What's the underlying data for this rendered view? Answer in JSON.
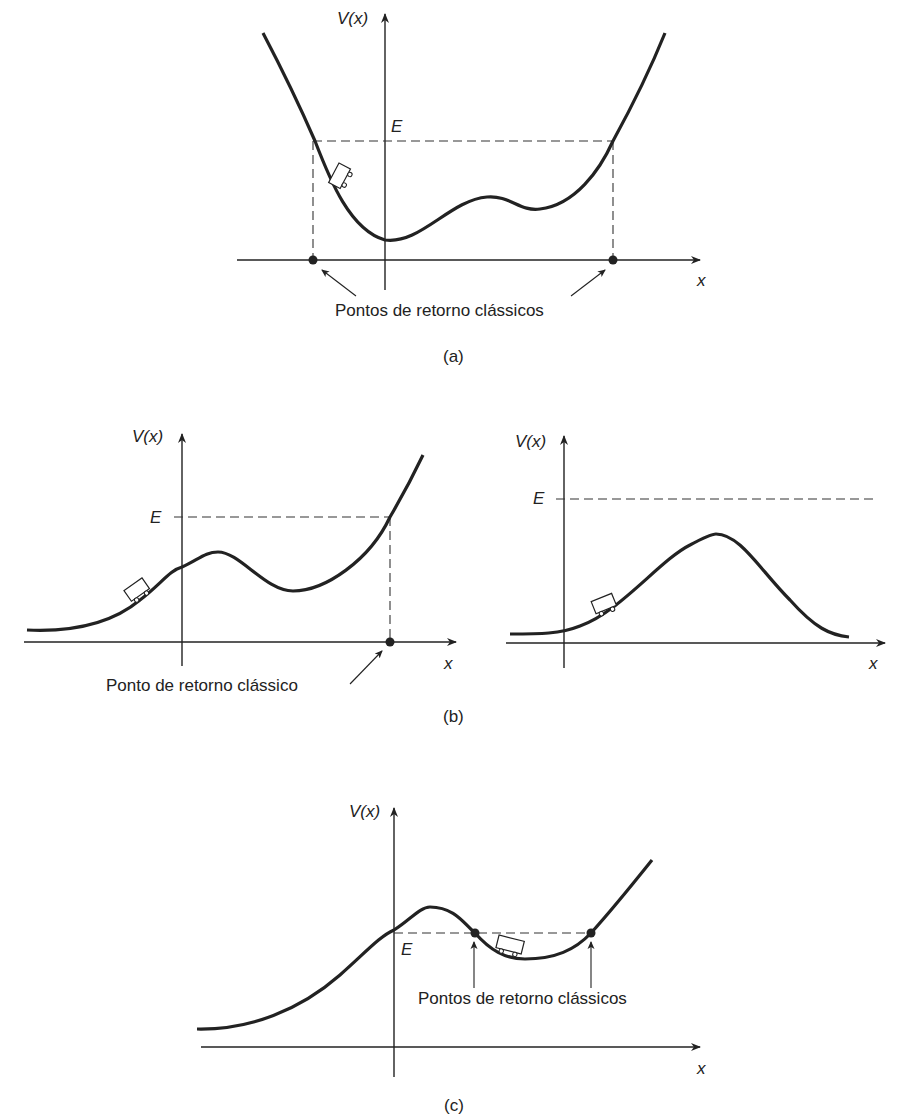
{
  "figure": {
    "panel_a": {
      "caption": "(a)",
      "y_axis_label": "V(x)",
      "x_axis_label": "x",
      "energy_label": "E",
      "annotation": "Pontos de retorno clássicos"
    },
    "panel_b_left": {
      "y_axis_label": "V(x)",
      "x_axis_label": "x",
      "energy_label": "E",
      "annotation": "Ponto de retorno clássico"
    },
    "panel_b_right": {
      "y_axis_label": "V(x)",
      "x_axis_label": "x",
      "energy_label": "E"
    },
    "panel_b_caption": "(b)",
    "panel_c": {
      "caption": "(c)",
      "y_axis_label": "V(x)",
      "x_axis_label": "x",
      "energy_label": "E",
      "annotation": "Pontos de retorno clássicos"
    },
    "colors": {
      "ink": "#222222",
      "background": "#ffffff"
    }
  }
}
